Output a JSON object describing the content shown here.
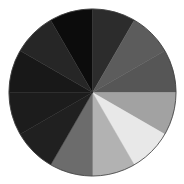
{
  "chart_data": {
    "type": "pie",
    "title": "",
    "center": [
      92.5,
      92.5
    ],
    "radius": 83.5,
    "start_angle_deg": -30,
    "direction": "clockwise",
    "labels": [
      "",
      "",
      "",
      "",
      "",
      "",
      "",
      "",
      "",
      "",
      "",
      ""
    ],
    "values": [
      30,
      30,
      30,
      30,
      30,
      30,
      30,
      30,
      30,
      30,
      30,
      30
    ],
    "colors": [
      "#0c0c0c",
      "#2c2c2c",
      "#5c5c5c",
      "#565656",
      "#a2a2a2",
      "#e8e8e8",
      "#b2b2b2",
      "#6c6c6c",
      "#202020",
      "#1c1c1c",
      "#181818",
      "#262626"
    ],
    "outline_color": "#3a3a3a",
    "legend": "none",
    "grid": false
  }
}
